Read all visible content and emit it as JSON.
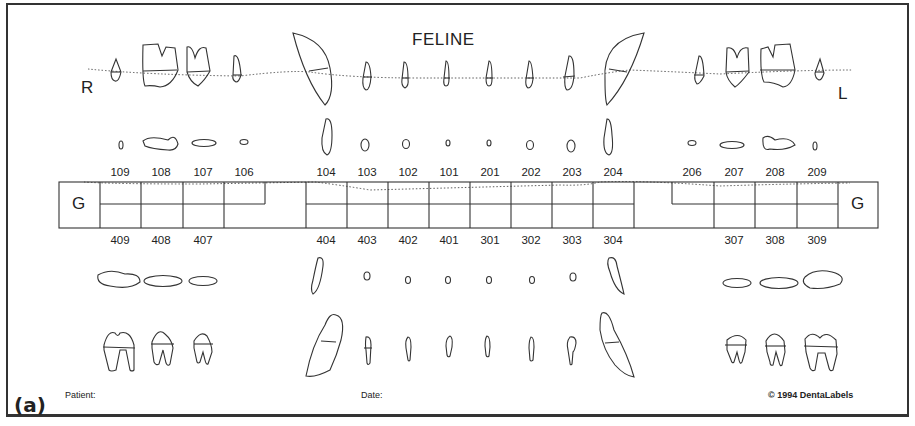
{
  "chart": {
    "title": "FELINE",
    "side_right": "R",
    "side_left": "L",
    "gingiva_label": "G",
    "upper_numbers": [
      "109",
      "108",
      "107",
      "106",
      "104",
      "103",
      "102",
      "101",
      "201",
      "202",
      "203",
      "204",
      "206",
      "207",
      "208",
      "209"
    ],
    "lower_numbers": [
      "409",
      "408",
      "407",
      "404",
      "403",
      "402",
      "401",
      "301",
      "302",
      "303",
      "304",
      "307",
      "308",
      "309"
    ]
  },
  "footer": {
    "figure_label": "(a)",
    "patient_label": "Patient:",
    "date_label": "Date:",
    "copyright": "© 1994 DentaLabels"
  }
}
